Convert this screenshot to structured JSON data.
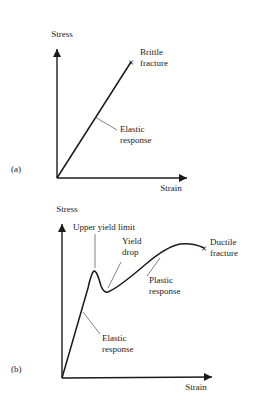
{
  "figure": {
    "background_color": "#ffffff",
    "line_color": "#1a1a1a",
    "leader_color": "#4a4a4a"
  },
  "panels": [
    {
      "tag": "(a)",
      "tag_name": "panel-a-tag",
      "description": "Brittle material: linear elastic response terminating at brittle fracture",
      "axes": {
        "y_label": "Stress",
        "x_label": "Strain",
        "origin": {
          "x": 57,
          "y": 178
        },
        "y_arrow_tip": {
          "x": 57,
          "y": 43
        },
        "x_arrow_tip": {
          "x": 193,
          "y": 178
        }
      },
      "curve": {
        "type": "line",
        "points": [
          {
            "x": 57,
            "y": 178
          },
          {
            "x": 131,
            "y": 62
          }
        ]
      },
      "markers": [
        {
          "symbol": "×",
          "name": "brittle-fracture-marker",
          "x": 131,
          "y": 62,
          "label_lines": [
            "Brittle",
            "fracture"
          ],
          "label_x": 140,
          "label_y": 55
        }
      ],
      "annotations": [
        {
          "name": "elastic-response-label-a",
          "lines": [
            "Elastic",
            "response"
          ],
          "text_x": 120,
          "text_y": 132,
          "leader": {
            "x1": 95,
            "y1": 117,
            "x2": 117,
            "y2": 130
          }
        }
      ]
    },
    {
      "tag": "(b)",
      "tag_name": "panel-b-tag",
      "description": "Ductile material: elastic response, upper yield limit, yield drop, plastic response, ductile fracture",
      "axes": {
        "y_label": "Stress",
        "x_label": "Strain",
        "origin": {
          "x": 62,
          "y": 378
        },
        "y_arrow_tip": {
          "x": 62,
          "y": 218
        },
        "x_arrow_tip": {
          "x": 218,
          "y": 377
        }
      },
      "curve": {
        "type": "line",
        "path": "M62,378 L88,288 C90,279 92,272 94,271 C97,271 99,279 101,286 C103,291 105,293 108,292 C118,288 132,276 146,264 C160,252 170,246 180,244 C190,243 198,245 204,248",
        "key_points": {
          "origin": {
            "x": 62,
            "y": 378
          },
          "elastic_end": {
            "x": 88,
            "y": 288
          },
          "upper_yield_peak": {
            "x": 94,
            "y": 271
          },
          "yield_trough": {
            "x": 108,
            "y": 292
          },
          "plastic_max": {
            "x": 180,
            "y": 244
          },
          "fracture": {
            "x": 204,
            "y": 248
          }
        }
      },
      "markers": [
        {
          "symbol": "×",
          "name": "ductile-fracture-marker",
          "x": 204,
          "y": 248,
          "label_lines": [
            "Ductile",
            "fracture"
          ],
          "label_x": 210,
          "label_y": 245
        }
      ],
      "annotations": [
        {
          "name": "upper-yield-limit-label",
          "lines": [
            "Upper yield limit"
          ],
          "text_x": 73,
          "text_y": 230,
          "leader": {
            "x1": 95,
            "y1": 234,
            "x2": 95,
            "y2": 268
          }
        },
        {
          "name": "yield-drop-label",
          "lines": [
            "Yield",
            "drop"
          ],
          "text_x": 122,
          "text_y": 244,
          "leader": {
            "x1": 121,
            "y1": 262,
            "x2": 108,
            "y2": 288
          }
        },
        {
          "name": "plastic-response-label",
          "lines": [
            "Plastic",
            "response"
          ],
          "text_x": 149,
          "text_y": 283,
          "leader": {
            "x1": 147,
            "y1": 276,
            "x2": 160,
            "y2": 258
          }
        },
        {
          "name": "elastic-response-label-b",
          "lines": [
            "Elastic",
            "response"
          ],
          "text_x": 102,
          "text_y": 341,
          "leader": {
            "x1": 83,
            "y1": 312,
            "x2": 100,
            "y2": 334
          }
        }
      ]
    }
  ]
}
